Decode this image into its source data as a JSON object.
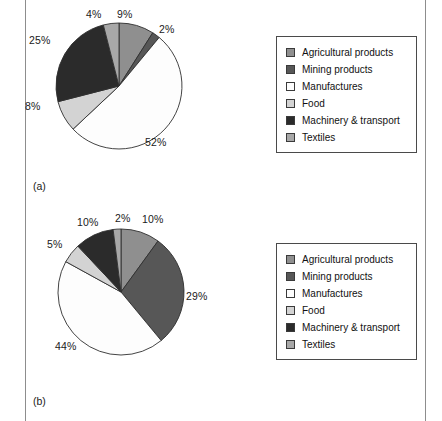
{
  "page": {
    "rules": [
      "left-page-rule",
      "right-page-rule"
    ]
  },
  "categories": [
    {
      "key": "agricultural",
      "label": "Agricultural products",
      "color": "#8f8f8f"
    },
    {
      "key": "mining",
      "label": "Mining products",
      "color": "#575757"
    },
    {
      "key": "manufactures",
      "label": "Manufactures",
      "color": "#fdfdfd"
    },
    {
      "key": "food",
      "label": "Food",
      "color": "#d3d3d3"
    },
    {
      "key": "machinery",
      "label": "Machinery & transport",
      "color": "#2b2b2b"
    },
    {
      "key": "textiles",
      "label": "Textiles",
      "color": "#a8a8a8"
    }
  ],
  "figures": [
    {
      "caption": "(a)"
    },
    {
      "caption": "(b)"
    }
  ],
  "chart_data": [
    {
      "type": "pie",
      "title": "(a)",
      "categories": [
        "Agricultural products",
        "Mining products",
        "Manufactures",
        "Food",
        "Machinery & transport",
        "Textiles"
      ],
      "values": [
        9,
        2,
        52,
        8,
        25,
        4
      ],
      "value_labels": [
        "9%",
        "2%",
        "52%",
        "8%",
        "25%",
        "4%"
      ],
      "colors": [
        "#8f8f8f",
        "#575757",
        "#fdfdfd",
        "#d3d3d3",
        "#2b2b2b",
        "#a8a8a8"
      ],
      "units": "percent",
      "start_angle_deg": 0,
      "direction": "clockwise",
      "legend_position": "right"
    },
    {
      "type": "pie",
      "title": "(b)",
      "categories": [
        "Agricultural products",
        "Mining products",
        "Manufactures",
        "Food",
        "Machinery & transport",
        "Textiles"
      ],
      "values": [
        10,
        29,
        44,
        5,
        10,
        2
      ],
      "value_labels": [
        "10%",
        "29%",
        "44%",
        "5%",
        "10%",
        "2%"
      ],
      "colors": [
        "#8f8f8f",
        "#575757",
        "#fdfdfd",
        "#d3d3d3",
        "#2b2b2b",
        "#a8a8a8"
      ],
      "units": "percent",
      "start_angle_deg": 0,
      "direction": "clockwise",
      "legend_position": "right"
    }
  ],
  "labels_a": {
    "agricultural": "9%",
    "mining": "2%",
    "manufactures": "52%",
    "food": "8%",
    "machinery": "25%",
    "textiles": "4%"
  },
  "labels_b": {
    "agricultural": "10%",
    "mining": "29%",
    "manufactures": "44%",
    "food": "5%",
    "machinery": "10%",
    "textiles": "2%"
  }
}
